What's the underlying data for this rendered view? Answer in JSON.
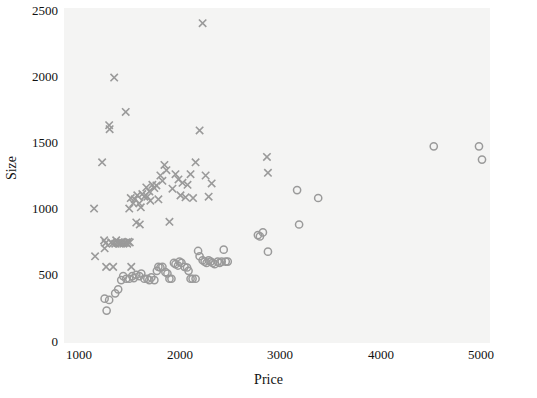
{
  "chart_data": {
    "type": "scatter",
    "title": "",
    "xlabel": "Price",
    "ylabel": "Size",
    "xlim": [
      1000,
      5100
    ],
    "ylim": [
      0,
      2560
    ],
    "grid": false,
    "legend": "none",
    "xticks": [
      1000,
      2000,
      3000,
      4000,
      5000
    ],
    "yticks": [
      0,
      500,
      1000,
      1500,
      2000,
      2500
    ],
    "xtick_labels": [
      "1000",
      "2000",
      "3000",
      "4000",
      "5000"
    ],
    "ytick_labels": [
      "0",
      "500",
      "1000",
      "1500",
      "2000",
      "2500"
    ],
    "background_color": "#f4f4f3",
    "marker_color": "#9a9a9a",
    "series": [
      {
        "name": "cross-series",
        "marker": "x",
        "color": "#9a9a9a",
        "points": [
          [
            1150,
            1000
          ],
          [
            1160,
            640
          ],
          [
            1230,
            1350
          ],
          [
            1250,
            760
          ],
          [
            1255,
            700
          ],
          [
            1265,
            740
          ],
          [
            1270,
            560
          ],
          [
            1300,
            1630
          ],
          [
            1305,
            1600
          ],
          [
            1320,
            745
          ],
          [
            1335,
            735
          ],
          [
            1340,
            560
          ],
          [
            1350,
            1990
          ],
          [
            1360,
            735
          ],
          [
            1370,
            760
          ],
          [
            1385,
            740
          ],
          [
            1395,
            745
          ],
          [
            1405,
            735
          ],
          [
            1415,
            740
          ],
          [
            1425,
            745
          ],
          [
            1440,
            735
          ],
          [
            1455,
            740
          ],
          [
            1465,
            1730
          ],
          [
            1470,
            745
          ],
          [
            1480,
            735
          ],
          [
            1490,
            750
          ],
          [
            1500,
            1000
          ],
          [
            1505,
            745
          ],
          [
            1515,
            1080
          ],
          [
            1520,
            560
          ],
          [
            1540,
            1040
          ],
          [
            1555,
            1070
          ],
          [
            1570,
            895
          ],
          [
            1580,
            1100
          ],
          [
            1600,
            1040
          ],
          [
            1605,
            880
          ],
          [
            1615,
            1010
          ],
          [
            1630,
            1110
          ],
          [
            1650,
            1090
          ],
          [
            1670,
            1160
          ],
          [
            1680,
            1090
          ],
          [
            1700,
            1130
          ],
          [
            1710,
            1060
          ],
          [
            1730,
            1180
          ],
          [
            1750,
            1155
          ],
          [
            1770,
            1175
          ],
          [
            1790,
            1070
          ],
          [
            1810,
            1250
          ],
          [
            1830,
            1210
          ],
          [
            1850,
            1330
          ],
          [
            1870,
            1290
          ],
          [
            1900,
            900
          ],
          [
            1930,
            1150
          ],
          [
            1960,
            1260
          ],
          [
            1990,
            1220
          ],
          [
            2010,
            1100
          ],
          [
            2030,
            1195
          ],
          [
            2060,
            1085
          ],
          [
            2080,
            1180
          ],
          [
            2110,
            1260
          ],
          [
            2135,
            1080
          ],
          [
            2160,
            1350
          ],
          [
            2200,
            1590
          ],
          [
            2230,
            2400
          ],
          [
            2260,
            1250
          ],
          [
            2290,
            1090
          ],
          [
            2320,
            1190
          ],
          [
            2870,
            1390
          ],
          [
            2880,
            1270
          ]
        ]
      },
      {
        "name": "circle-series",
        "marker": "o",
        "color": "#9a9a9a",
        "points": [
          [
            1255,
            320
          ],
          [
            1275,
            230
          ],
          [
            1300,
            310
          ],
          [
            1360,
            360
          ],
          [
            1390,
            390
          ],
          [
            1420,
            460
          ],
          [
            1440,
            490
          ],
          [
            1470,
            470
          ],
          [
            1500,
            470
          ],
          [
            1530,
            490
          ],
          [
            1545,
            475
          ],
          [
            1570,
            500
          ],
          [
            1600,
            490
          ],
          [
            1620,
            510
          ],
          [
            1650,
            470
          ],
          [
            1680,
            470
          ],
          [
            1700,
            460
          ],
          [
            1720,
            480
          ],
          [
            1750,
            460
          ],
          [
            1775,
            530
          ],
          [
            1790,
            560
          ],
          [
            1810,
            555
          ],
          [
            1830,
            560
          ],
          [
            1860,
            520
          ],
          [
            1880,
            510
          ],
          [
            1900,
            470
          ],
          [
            1920,
            470
          ],
          [
            1945,
            590
          ],
          [
            1960,
            580
          ],
          [
            1985,
            570
          ],
          [
            2000,
            600
          ],
          [
            2020,
            590
          ],
          [
            2050,
            560
          ],
          [
            2075,
            555
          ],
          [
            2090,
            530
          ],
          [
            2110,
            470
          ],
          [
            2130,
            470
          ],
          [
            2160,
            470
          ],
          [
            2185,
            680
          ],
          [
            2200,
            640
          ],
          [
            2230,
            610
          ],
          [
            2250,
            600
          ],
          [
            2270,
            590
          ],
          [
            2290,
            610
          ],
          [
            2310,
            600
          ],
          [
            2330,
            590
          ],
          [
            2350,
            580
          ],
          [
            2380,
            600
          ],
          [
            2400,
            590
          ],
          [
            2420,
            600
          ],
          [
            2440,
            690
          ],
          [
            2460,
            600
          ],
          [
            2480,
            600
          ],
          [
            2780,
            800
          ],
          [
            2800,
            790
          ],
          [
            2830,
            820
          ],
          [
            2880,
            675
          ],
          [
            3170,
            1140
          ],
          [
            3190,
            880
          ],
          [
            3380,
            1080
          ],
          [
            4530,
            1470
          ],
          [
            4980,
            1470
          ],
          [
            5010,
            1370
          ]
        ]
      }
    ]
  },
  "axes": {
    "x_axis_name": "price-axis",
    "y_axis_name": "size-axis"
  }
}
